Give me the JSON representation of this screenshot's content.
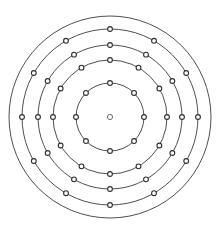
{
  "figure": {
    "background_color": "#ffffff",
    "width": 220,
    "height": 233
  },
  "chart_data": {
    "type": "scatter",
    "subtitle": "",
    "xlabel": "",
    "ylabel": "",
    "grid": false,
    "legend": "none",
    "coordinate_system": "polar",
    "center": {
      "x": 110,
      "y": 117
    },
    "center_marker": {
      "label": "center-node",
      "radius": 2.6,
      "fill_color": "#ffffff",
      "stroke_color": "#5c5c5c"
    },
    "ring_stroke_color": "#3b3b3b",
    "node_fill_color": "#ffffff",
    "node_stroke_color": "#2e2e2e",
    "rings": [
      {
        "index": 1,
        "name": "ring-inner",
        "radius": 34,
        "node_count": 8,
        "node_radius": 2.4,
        "start_angle_deg": 0,
        "angle_step_deg": 45
      },
      {
        "index": 2,
        "name": "ring-second",
        "radius": 57,
        "node_count": 12,
        "node_radius": 2.4,
        "start_angle_deg": 0,
        "angle_step_deg": 30
      },
      {
        "index": 3,
        "name": "ring-third",
        "radius": 72,
        "node_count": 12,
        "node_radius": 2.4,
        "start_angle_deg": 0,
        "angle_step_deg": 30
      },
      {
        "index": 4,
        "name": "ring-fourth",
        "radius": 88,
        "node_count": 12,
        "node_radius": 2.4,
        "start_angle_deg": 0,
        "angle_step_deg": 30
      },
      {
        "index": 5,
        "name": "ring-outer",
        "radius": 101,
        "node_count": 0,
        "node_radius": 0,
        "start_angle_deg": 0,
        "angle_step_deg": 0
      }
    ]
  }
}
